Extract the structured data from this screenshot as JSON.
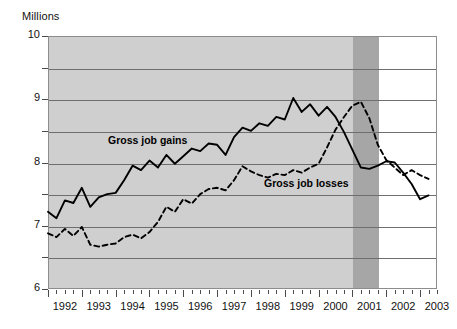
{
  "chart": {
    "y_axis_title": "Millions",
    "annotations": [
      {
        "id": "gains",
        "text": "Gross job gains"
      },
      {
        "id": "losses",
        "text": "Gross job losses"
      }
    ],
    "y_labels": [
      "10",
      "9",
      "8",
      "7",
      "6"
    ],
    "x_labels": [
      "1992",
      "1993",
      "1994",
      "1995",
      "1996",
      "1997",
      "1998",
      "1999",
      "2000",
      "2001",
      "2002",
      "2003"
    ],
    "colors": {
      "plot_shading": "#cfcfcf",
      "recession_shading": "#a6a6a6",
      "gridline": "#6e6e6e",
      "frame": "#8c8c8c",
      "series_line": "#000000",
      "background": "#ffffff"
    }
  },
  "chart_data": {
    "type": "line",
    "title": "",
    "subtitle": "",
    "xlabel": "",
    "ylabel": "Millions",
    "xlim": [
      1992.0,
      2003.5
    ],
    "ylim": [
      6,
      10
    ],
    "y_ticks": [
      6,
      6.5,
      7,
      7.5,
      8,
      8.5,
      9,
      9.5,
      10
    ],
    "y_tick_labels": [
      "6",
      "",
      "7",
      "",
      "8",
      "",
      "9",
      "",
      "10"
    ],
    "x_ticks": [
      1992,
      1993,
      1994,
      1995,
      1996,
      1997,
      1998,
      1999,
      2000,
      2001,
      2002,
      2003
    ],
    "x_minor_interval": 0.25,
    "grid": true,
    "grid_axis": "y",
    "legend": "inline-annotations",
    "shaded_regions": [
      {
        "name": "data-shading",
        "x_start": 1992.0,
        "x_end": 2001.0,
        "color": "#cfcfcf"
      },
      {
        "name": "recession-band",
        "x_start": 2001.0,
        "x_end": 2001.75,
        "color": "#a6a6a6"
      }
    ],
    "series": [
      {
        "name": "Gross job gains",
        "style": "solid",
        "x": [
          1992.0,
          1992.25,
          1992.5,
          1992.75,
          1993.0,
          1993.25,
          1993.5,
          1993.75,
          1994.0,
          1994.25,
          1994.5,
          1994.75,
          1995.0,
          1995.25,
          1995.5,
          1995.75,
          1996.0,
          1996.25,
          1996.5,
          1996.75,
          1997.0,
          1997.25,
          1997.5,
          1997.75,
          1998.0,
          1998.25,
          1998.5,
          1998.75,
          1999.0,
          1999.25,
          1999.5,
          1999.75,
          2000.0,
          2000.25,
          2000.5,
          2000.75,
          2001.0,
          2001.25,
          2001.5,
          2001.75,
          2002.0,
          2002.25,
          2002.5,
          2002.75,
          2003.0,
          2003.25
        ],
        "values": [
          7.22,
          7.12,
          7.4,
          7.36,
          7.6,
          7.3,
          7.45,
          7.5,
          7.52,
          7.72,
          7.95,
          7.88,
          8.03,
          7.92,
          8.12,
          7.98,
          8.1,
          8.22,
          8.18,
          8.3,
          8.28,
          8.12,
          8.4,
          8.55,
          8.5,
          8.62,
          8.58,
          8.72,
          8.68,
          9.02,
          8.8,
          8.92,
          8.74,
          8.88,
          8.72,
          8.48,
          8.2,
          7.92,
          7.9,
          7.95,
          8.02,
          8.0,
          7.84,
          7.66,
          7.42,
          7.48
        ]
      },
      {
        "name": "Gross job losses",
        "style": "dashed",
        "x": [
          1992.0,
          1992.25,
          1992.5,
          1992.75,
          1993.0,
          1993.25,
          1993.5,
          1993.75,
          1994.0,
          1994.25,
          1994.5,
          1994.75,
          1995.0,
          1995.25,
          1995.5,
          1995.75,
          1996.0,
          1996.25,
          1996.5,
          1996.75,
          1997.0,
          1997.25,
          1997.5,
          1997.75,
          1998.0,
          1998.25,
          1998.5,
          1998.75,
          1999.0,
          1999.25,
          1999.5,
          1999.75,
          2000.0,
          2000.25,
          2000.5,
          2000.75,
          2001.0,
          2001.25,
          2001.5,
          2001.75,
          2002.0,
          2002.25,
          2002.5,
          2002.75,
          2003.0,
          2003.25
        ],
        "values": [
          6.88,
          6.82,
          6.95,
          6.84,
          6.98,
          6.7,
          6.67,
          6.7,
          6.72,
          6.82,
          6.86,
          6.8,
          6.9,
          7.06,
          7.3,
          7.22,
          7.42,
          7.35,
          7.5,
          7.58,
          7.6,
          7.56,
          7.72,
          7.94,
          7.86,
          7.8,
          7.76,
          7.82,
          7.8,
          7.88,
          7.84,
          7.92,
          7.98,
          8.24,
          8.52,
          8.72,
          8.9,
          8.96,
          8.7,
          8.28,
          8.04,
          7.92,
          7.8,
          7.88,
          7.8,
          7.74
        ]
      }
    ]
  }
}
